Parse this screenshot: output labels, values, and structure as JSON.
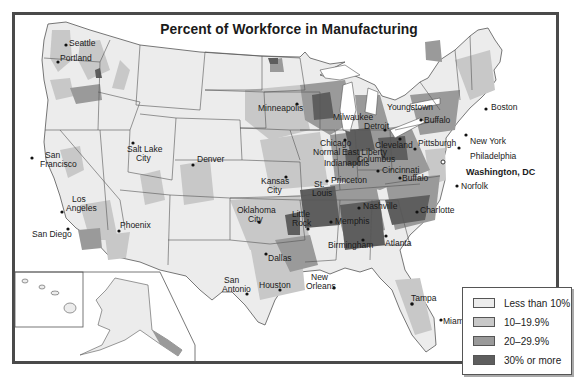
{
  "title": "Percent of Workforce in Manufacturing",
  "legend": {
    "items": [
      {
        "label": "Less than 10%",
        "color": "#ececec"
      },
      {
        "label": "10–19.9%",
        "color": "#c8c8c8"
      },
      {
        "label": "20–29.9%",
        "color": "#9a9a9a"
      },
      {
        "label": "30% or more",
        "color": "#5e5e5e"
      }
    ]
  },
  "cities": {
    "seattle": "Seattle",
    "portland": "Portland",
    "san_francisco_1": "San",
    "san_francisco_2": "Francisco",
    "salt_lake_1": "Salt Lake",
    "salt_lake_2": "City",
    "denver": "Denver",
    "los_angeles_1": "Los",
    "los_angeles_2": "Angeles",
    "san_diego": "San Diego",
    "phoenix": "Phoenix",
    "minneapolis": "Minneapolis",
    "milwaukee": "Milwaukee",
    "detroit": "Detroit",
    "chicago": "Chicago",
    "normal": "Normal",
    "east_liberty": "East Liberty",
    "columbus": "Columbus",
    "indianapolis": "Indianapolis",
    "cleveland": "Cleveland",
    "youngstown": "Youngstown",
    "buffalo_ny": "Buffalo",
    "pittsburgh": "Pittsburgh",
    "boston": "Boston",
    "new_york": "New York",
    "philadelphia": "Philadelphia",
    "washington": "Washington, DC",
    "norfolk": "Norfolk",
    "cincinnati": "Cincinnati",
    "buffalo_wv": "Buffalo",
    "kansas_city_1": "Kansas",
    "kansas_city_2": "City",
    "st_louis_1": "St.",
    "st_louis_2": "Louis",
    "princeton": "Princeton",
    "nashville": "Nashville",
    "charlotte": "Charlotte",
    "oklahoma_city_1": "Oklahoma",
    "oklahoma_city_2": "City",
    "little_rock_1": "Little",
    "little_rock_2": "Rock",
    "memphis": "Memphis",
    "birmingham": "Birmingham",
    "atlanta": "Atlanta",
    "dallas": "Dallas",
    "san_antonio_1": "San",
    "san_antonio_2": "Antonio",
    "houston": "Houston",
    "new_orleans_1": "New",
    "new_orleans_2": "Orleans",
    "tampa": "Tampa",
    "miami": "Miami"
  }
}
